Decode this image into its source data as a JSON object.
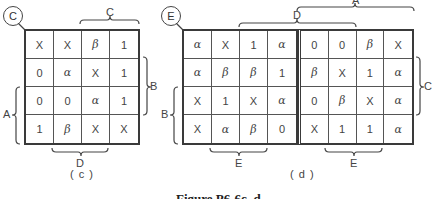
{
  "figure_caption": "Figure P6-6c, d",
  "map_c": {
    "id_label": "C",
    "sub_caption": "( c )",
    "rows": [
      [
        "X",
        "X",
        "β",
        "1"
      ],
      [
        "0",
        "α",
        "X",
        "1"
      ],
      [
        "0",
        "0",
        "α",
        "1"
      ],
      [
        "1",
        "β",
        "X",
        "X"
      ]
    ],
    "brace_labels": {
      "top": "C",
      "right": "B",
      "left": "A",
      "bottom": "D"
    }
  },
  "map_d": {
    "id_label": "E",
    "sub_caption": "( d )",
    "rows": [
      [
        "α",
        "X",
        "1",
        "α",
        "0",
        "0",
        "β",
        "X"
      ],
      [
        "α",
        "β",
        "β",
        "1",
        "β",
        "X",
        "1",
        "α"
      ],
      [
        "X",
        "1",
        "X",
        "α",
        "0",
        "β",
        "X",
        "α"
      ],
      [
        "X",
        "α",
        "β",
        "0",
        "X",
        "1",
        "1",
        "α"
      ]
    ],
    "brace_labels": {
      "top_outer": "A",
      "top_inner": "D",
      "right": "C",
      "left": "B",
      "bottom_left": "E",
      "bottom_right": "E"
    }
  }
}
